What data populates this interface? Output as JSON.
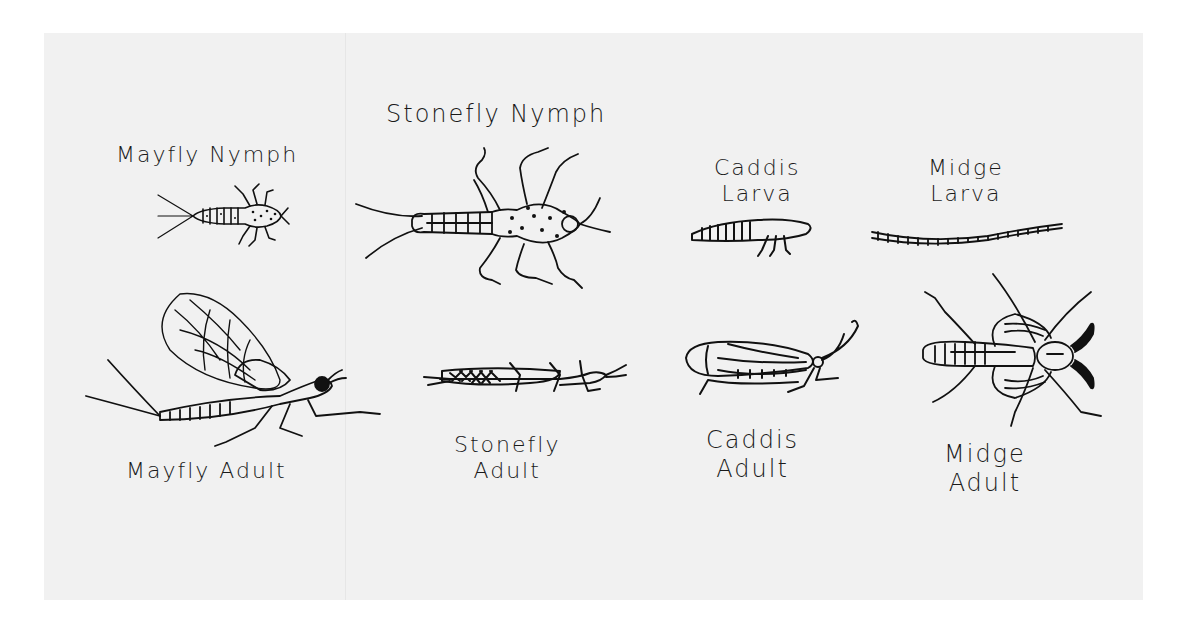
{
  "page": {
    "background": "#ffffff",
    "paper_color": "#f1f1f1",
    "ink_color": "#111111"
  },
  "insects": [
    {
      "id": "mayfly-nymph",
      "label": "Mayfly Nymph",
      "icon": "mayfly-nymph-drawing"
    },
    {
      "id": "stonefly-nymph",
      "label": "Stonefly Nymph",
      "icon": "stonefly-nymph-drawing"
    },
    {
      "id": "caddis-larva",
      "label": "Caddis\nLarva",
      "icon": "caddis-larva-drawing"
    },
    {
      "id": "midge-larva",
      "label": "Midge\nLarva",
      "icon": "midge-larva-drawing"
    },
    {
      "id": "mayfly-adult",
      "label": "Mayfly Adult",
      "icon": "mayfly-adult-drawing"
    },
    {
      "id": "stonefly-adult",
      "label": "Stonefly\nAdult",
      "icon": "stonefly-adult-drawing"
    },
    {
      "id": "caddis-adult",
      "label": "Caddis\nAdult",
      "icon": "caddis-adult-drawing"
    },
    {
      "id": "midge-adult",
      "label": "Midge\nAdult",
      "icon": "midge-adult-drawing"
    }
  ]
}
